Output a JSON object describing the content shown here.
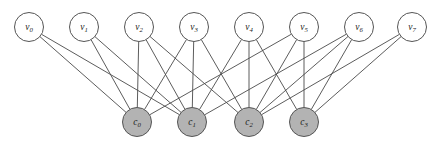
{
  "figure": {
    "name": "bipartite-graph",
    "width": 440,
    "height": 144,
    "background_color": "#ffffff"
  },
  "style": {
    "top_node_fill": "#ffffff",
    "bottom_node_fill": "#b3b3b3",
    "node_stroke": "#555555",
    "edge_color": "#4a4a4a",
    "label_color": "#1a1a1a",
    "node_radius": 14.5,
    "edge_width": 0.9
  },
  "chart_data": {
    "type": "diagram",
    "title": "",
    "graph_kind": "bipartite",
    "top_nodes": [
      {
        "id": "v0",
        "base": "v",
        "sub": "0",
        "label": "v0",
        "cx": 29,
        "cy": 27,
        "r": 14.5,
        "fill": "#ffffff"
      },
      {
        "id": "v1",
        "base": "v",
        "sub": "1",
        "label": "v1",
        "cx": 84,
        "cy": 27,
        "r": 14.5,
        "fill": "#ffffff"
      },
      {
        "id": "v2",
        "base": "v",
        "sub": "2",
        "label": "v2",
        "cx": 139,
        "cy": 27,
        "r": 14.5,
        "fill": "#ffffff"
      },
      {
        "id": "v3",
        "base": "v",
        "sub": "3",
        "label": "v3",
        "cx": 194,
        "cy": 27,
        "r": 14.5,
        "fill": "#ffffff"
      },
      {
        "id": "v4",
        "base": "v",
        "sub": "4",
        "label": "v4",
        "cx": 249,
        "cy": 27,
        "r": 14.5,
        "fill": "#ffffff"
      },
      {
        "id": "v5",
        "base": "v",
        "sub": "5",
        "label": "v5",
        "cx": 304,
        "cy": 27,
        "r": 14.5,
        "fill": "#ffffff"
      },
      {
        "id": "v6",
        "base": "v",
        "sub": "6",
        "label": "v6",
        "cx": 359,
        "cy": 27,
        "r": 14.5,
        "fill": "#ffffff"
      },
      {
        "id": "v7",
        "base": "v",
        "sub": "7",
        "label": "v7",
        "cx": 412,
        "cy": 27,
        "r": 14.5,
        "fill": "#ffffff"
      }
    ],
    "bottom_nodes": [
      {
        "id": "c0",
        "base": "c",
        "sub": "0",
        "label": "c0",
        "cx": 137,
        "cy": 122,
        "r": 14.5,
        "fill": "#b3b3b3"
      },
      {
        "id": "c1",
        "base": "c",
        "sub": "1",
        "label": "c1",
        "cx": 192,
        "cy": 122,
        "r": 14.5,
        "fill": "#b3b3b3"
      },
      {
        "id": "c2",
        "base": "c",
        "sub": "2",
        "label": "c2",
        "cx": 249,
        "cy": 122,
        "r": 14.5,
        "fill": "#b3b3b3"
      },
      {
        "id": "c3",
        "base": "c",
        "sub": "3",
        "label": "c3",
        "cx": 304,
        "cy": 122,
        "r": 14.5,
        "fill": "#b3b3b3"
      }
    ],
    "edges": [
      {
        "from": "v0",
        "to": "c0"
      },
      {
        "from": "v0",
        "to": "c1"
      },
      {
        "from": "v1",
        "to": "c0"
      },
      {
        "from": "v1",
        "to": "c1"
      },
      {
        "from": "v2",
        "to": "c0"
      },
      {
        "from": "v2",
        "to": "c1"
      },
      {
        "from": "v2",
        "to": "c2"
      },
      {
        "from": "v3",
        "to": "c0"
      },
      {
        "from": "v3",
        "to": "c1"
      },
      {
        "from": "v3",
        "to": "c2"
      },
      {
        "from": "v4",
        "to": "c1"
      },
      {
        "from": "v4",
        "to": "c2"
      },
      {
        "from": "v4",
        "to": "c3"
      },
      {
        "from": "v5",
        "to": "c0"
      },
      {
        "from": "v5",
        "to": "c2"
      },
      {
        "from": "v5",
        "to": "c3"
      },
      {
        "from": "v6",
        "to": "c1"
      },
      {
        "from": "v6",
        "to": "c2"
      },
      {
        "from": "v6",
        "to": "c3"
      },
      {
        "from": "v7",
        "to": "c2"
      },
      {
        "from": "v7",
        "to": "c3"
      }
    ],
    "top_node_count": 8,
    "bottom_node_count": 4,
    "edge_count": 21
  }
}
